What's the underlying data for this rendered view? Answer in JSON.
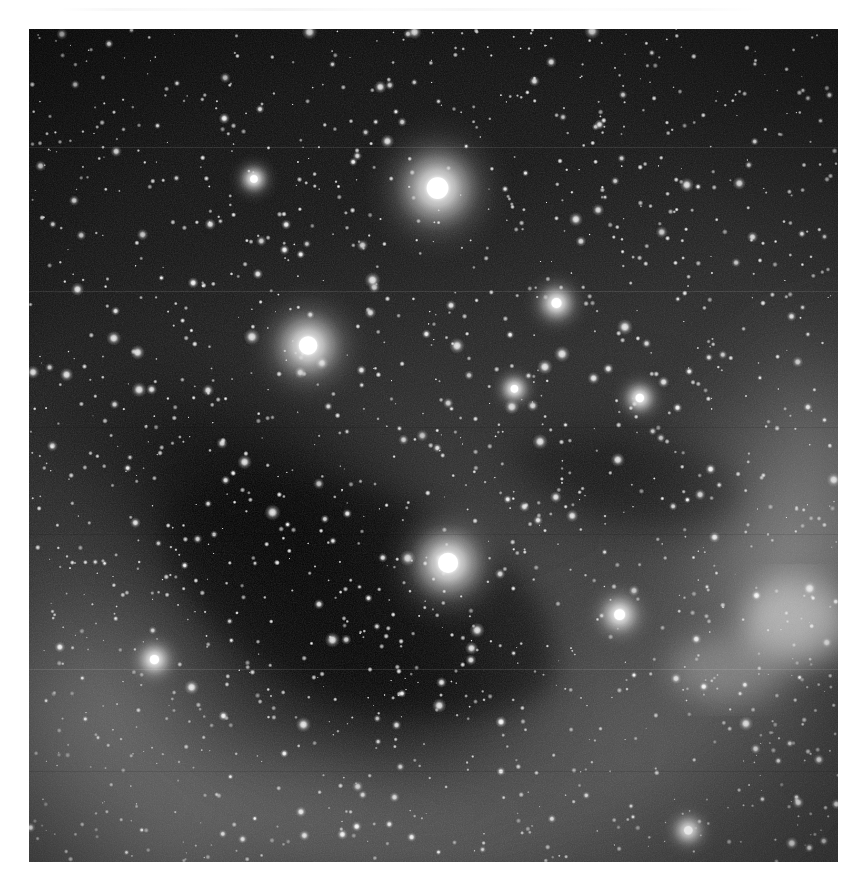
{
  "page": {
    "background_color": "#ffffff",
    "width": 867,
    "height": 894,
    "top_artifact_label": "scan-edge-artifact"
  },
  "figure": {
    "kind": "astronomical-photograph",
    "medium": "grayscale photographic plate",
    "subject": "dense galactic star field with dark nebula and diffuse emission nebulosity",
    "frame": {
      "x": 29,
      "y": 29,
      "width": 809,
      "height": 833
    },
    "border_color": "#b8b8b8",
    "colors": {
      "darkest_sky": "#060606",
      "dark_sky": "#101010",
      "mid_sky": "#3a3a3a",
      "bright_nebula": "#8e8e8e",
      "star_core": "#ffffff",
      "star_halo": "#c9c9c9"
    },
    "regions": [
      {
        "name": "dark-sky-upper-right",
        "cx": 0.72,
        "cy": 0.14,
        "level": "very-dark"
      },
      {
        "name": "dark-nebula-central-left",
        "cx": 0.3,
        "cy": 0.62,
        "level": "very-dark"
      },
      {
        "name": "diffuse-glow-lower-left",
        "cx": 0.1,
        "cy": 0.82,
        "level": "bright"
      },
      {
        "name": "bright-nebulosity-right",
        "cx": 0.92,
        "cy": 0.66,
        "level": "bright"
      },
      {
        "name": "emission-knot-lower-right",
        "cx": 0.94,
        "cy": 0.71,
        "level": "brightest"
      },
      {
        "name": "mid-level-field-lower-half",
        "cx": 0.5,
        "cy": 0.8,
        "level": "medium"
      }
    ],
    "bright_stars": [
      {
        "id": "star-A",
        "x": 0.505,
        "y": 0.191,
        "radius": 26,
        "magnitude_rank": 1
      },
      {
        "id": "star-B",
        "x": 0.345,
        "y": 0.38,
        "radius": 22,
        "magnitude_rank": 2
      },
      {
        "id": "star-C",
        "x": 0.518,
        "y": 0.641,
        "radius": 24,
        "magnitude_rank": 1
      },
      {
        "id": "star-D",
        "x": 0.652,
        "y": 0.329,
        "radius": 12,
        "magnitude_rank": 3
      },
      {
        "id": "star-E",
        "x": 0.73,
        "y": 0.703,
        "radius": 13,
        "magnitude_rank": 3
      },
      {
        "id": "star-F",
        "x": 0.155,
        "y": 0.757,
        "radius": 11,
        "magnitude_rank": 4
      },
      {
        "id": "star-G",
        "x": 0.755,
        "y": 0.443,
        "radius": 10,
        "magnitude_rank": 4
      },
      {
        "id": "star-H",
        "x": 0.278,
        "y": 0.18,
        "radius": 9,
        "magnitude_rank": 4
      },
      {
        "id": "star-I",
        "x": 0.6,
        "y": 0.432,
        "radius": 9,
        "magnitude_rank": 4
      },
      {
        "id": "star-J",
        "x": 0.815,
        "y": 0.962,
        "radius": 10,
        "magnitude_rank": 4
      }
    ],
    "field_star_count_estimate": 1400
  }
}
